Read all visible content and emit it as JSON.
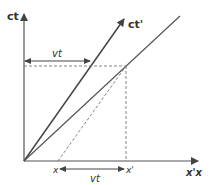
{
  "diagram": {
    "type": "spacetime (Minkowski) diagram",
    "axes": {
      "ct_label": "ct",
      "ct_prime_label": "ct'",
      "x_axis_label": "x'x"
    },
    "annotations": {
      "vt_top": "vt",
      "vt_bottom": "vt",
      "x_label": "x",
      "x_prime_label": "x'"
    },
    "colors": {
      "axis": "#555555",
      "line": "#444444",
      "dashed": "#777777",
      "text": "#333333"
    }
  }
}
